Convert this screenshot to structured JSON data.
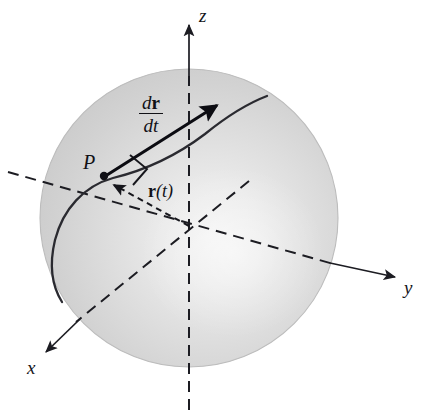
{
  "figure": {
    "background_color": "#ffffff",
    "width": 431,
    "height": 410
  },
  "sphere": {
    "center_x": 189,
    "center_y": 218,
    "radius": 149,
    "fill_base_color": "#c9c9c9",
    "fill_mid_color": "#d7d7d7",
    "highlight_color": "#f1f1f1",
    "edge_color": "#c2c2c2",
    "highlight_center_x": 232,
    "highlight_center_y": 252
  },
  "axes": {
    "line_color": "#1c1c22",
    "dash_pattern": "11 7",
    "z": {
      "label": "z",
      "label_x": 199,
      "label_y": 6,
      "arrow_tip_x": 189,
      "arrow_tip_y": 25,
      "solid_top_y": 25,
      "solid_bottom_y": 76,
      "dash_bottom_y": 410
    },
    "y": {
      "label": "y",
      "label_x": 404,
      "label_y": 278,
      "arrow_tip_x": 397,
      "arrow_tip_y": 277,
      "solid_start_x": 337,
      "solid_start_y": 265,
      "dash_back_end_x": 8,
      "dash_back_end_y": 172
    },
    "x": {
      "label": "x",
      "label_x": 27,
      "label_y": 358,
      "arrow_tip_x": 44,
      "arrow_tip_y": 354,
      "solid_start_x": 76,
      "solid_start_y": 322,
      "dash_back_end_x": 249,
      "dash_back_end_y": 181
    }
  },
  "curve": {
    "name": "space-curve-on-sphere",
    "color": "#2a2a30",
    "stroke_width": 2.3,
    "start_x": 267,
    "start_y": 96,
    "end_x": 62,
    "end_y": 302
  },
  "point_p": {
    "label": "P",
    "label_x": 83,
    "label_y": 152,
    "dot_x": 104,
    "dot_y": 176,
    "dot_radius": 4.2,
    "dot_color": "#101016"
  },
  "tangent_vector": {
    "label_numerator_d": "d",
    "label_numerator_r": "r",
    "label_denominator_d": "d",
    "label_denominator_t": "t",
    "label_x": 139,
    "label_y": 92,
    "color": "#0c0c12",
    "stroke_width": 3.1,
    "tail_x": 106,
    "tail_y": 174,
    "tip_x": 219,
    "tip_y": 104
  },
  "position_vector": {
    "label_r": "r",
    "label_paren_open": "(",
    "label_t": "t",
    "label_paren_close": ")",
    "label_x": 148,
    "label_y": 182,
    "color": "#16161c",
    "stroke_width": 2.0,
    "dash_pattern": "6 4.5",
    "tail_x": 189,
    "tail_y": 226,
    "tip_x": 112,
    "tip_y": 184
  },
  "right_angle_marker": {
    "name": "right-angle-marker",
    "color": "#16161c",
    "stroke_width": 1.9,
    "points": "131,156 147,170 132,184"
  }
}
